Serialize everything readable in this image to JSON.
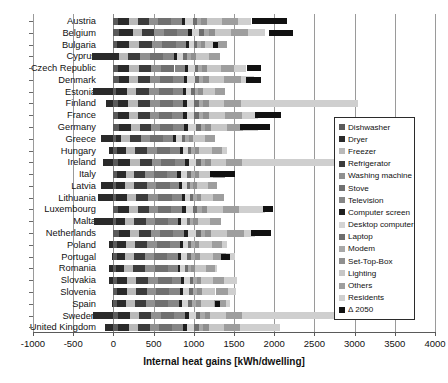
{
  "chart_data": {
    "type": "bar",
    "orientation": "horizontal",
    "stacked": true,
    "title": "",
    "xlabel": "Internal heat gains [kWh/dwelling]",
    "ylabel": "",
    "xlim": [
      -1000,
      4000
    ],
    "xticks": [
      -1000,
      -500,
      0,
      500,
      1000,
      1500,
      2000,
      2500,
      3000,
      3500,
      4000
    ],
    "grid": true,
    "legend_position": "right-inside",
    "categories": [
      "Austria",
      "Belgium",
      "Bulgaria",
      "Cyprus",
      "Czech Republic",
      "Denmark",
      "Estonia",
      "Finland",
      "France",
      "Germany",
      "Greece",
      "Hungary",
      "Ireland",
      "Italy",
      "Latvia",
      "Lithuania",
      "Luxembourg",
      "Malta",
      "Netherlands",
      "Poland",
      "Portugal",
      "Romania",
      "Slovakia",
      "Slovenia",
      "Spain",
      "Sweden",
      "United Kingdom"
    ],
    "series": [
      {
        "name": "Dishwasher",
        "color": "#5a5a5a",
        "values": [
          60,
          70,
          40,
          0,
          55,
          65,
          35,
          55,
          60,
          65,
          30,
          40,
          60,
          45,
          30,
          35,
          60,
          30,
          70,
          45,
          40,
          35,
          40,
          45,
          45,
          60,
          55
        ]
      },
      {
        "name": "Dryer",
        "color": "#2a2a2a",
        "values": [
          130,
          170,
          160,
          75,
          145,
          130,
          130,
          130,
          140,
          150,
          70,
          120,
          150,
          110,
          120,
          130,
          135,
          120,
          140,
          110,
          110,
          100,
          125,
          120,
          115,
          145,
          140
        ]
      },
      {
        "name": "Freezer",
        "color": "#b9b9b9",
        "values": [
          110,
          115,
          120,
          110,
          115,
          115,
          120,
          115,
          110,
          110,
          105,
          110,
          115,
          105,
          110,
          115,
          110,
          105,
          110,
          115,
          105,
          110,
          115,
          110,
          105,
          115,
          110
        ]
      },
      {
        "name": "Refrigerator",
        "color": "#3c3c3c",
        "values": [
          140,
          150,
          165,
          150,
          155,
          145,
          160,
          155,
          140,
          140,
          140,
          150,
          150,
          135,
          155,
          155,
          140,
          145,
          145,
          150,
          140,
          150,
          155,
          145,
          140,
          150,
          145
        ]
      },
      {
        "name": "Washing machine",
        "color": "#909090",
        "values": [
          120,
          120,
          125,
          120,
          120,
          120,
          125,
          120,
          115,
          120,
          115,
          120,
          120,
          115,
          120,
          125,
          115,
          115,
          120,
          120,
          115,
          120,
          120,
          115,
          115,
          120,
          120
        ]
      },
      {
        "name": "Stove",
        "color": "#707070",
        "values": [
          160,
          165,
          170,
          165,
          170,
          165,
          175,
          165,
          160,
          160,
          160,
          165,
          165,
          155,
          170,
          170,
          160,
          160,
          160,
          165,
          160,
          170,
          170,
          160,
          160,
          165,
          165
        ]
      },
      {
        "name": "Television",
        "color": "#868686",
        "values": [
          130,
          135,
          120,
          130,
          130,
          135,
          120,
          130,
          135,
          135,
          125,
          120,
          135,
          130,
          115,
          120,
          135,
          130,
          135,
          120,
          130,
          115,
          120,
          130,
          130,
          135,
          135
        ]
      },
      {
        "name": "Computer screen",
        "color": "#1f1f1f",
        "values": [
          45,
          50,
          35,
          40,
          40,
          45,
          35,
          45,
          50,
          50,
          35,
          35,
          45,
          40,
          30,
          35,
          45,
          35,
          50,
          35,
          40,
          30,
          35,
          40,
          40,
          45,
          45
        ]
      },
      {
        "name": "Desktop computer",
        "color": "#d4d4d4",
        "values": [
          90,
          95,
          70,
          80,
          80,
          90,
          70,
          90,
          95,
          95,
          70,
          70,
          90,
          80,
          65,
          70,
          90,
          70,
          95,
          70,
          80,
          60,
          70,
          80,
          80,
          90,
          90
        ]
      },
      {
        "name": "Laptop",
        "color": "#6e6e6e",
        "values": [
          55,
          60,
          40,
          45,
          45,
          55,
          40,
          55,
          60,
          60,
          40,
          40,
          55,
          45,
          35,
          40,
          55,
          40,
          60,
          40,
          45,
          35,
          40,
          45,
          45,
          55,
          55
        ]
      },
      {
        "name": "Modem",
        "color": "#a8a8a8",
        "values": [
          55,
          55,
          45,
          50,
          50,
          55,
          45,
          55,
          55,
          55,
          45,
          45,
          55,
          50,
          40,
          45,
          55,
          45,
          55,
          45,
          50,
          40,
          45,
          50,
          50,
          55,
          55
        ]
      },
      {
        "name": "Set-Top-Box",
        "color": "#8f8f8f",
        "values": [
          70,
          75,
          55,
          60,
          60,
          70,
          55,
          70,
          75,
          75,
          55,
          55,
          70,
          60,
          50,
          55,
          70,
          55,
          75,
          55,
          60,
          50,
          55,
          60,
          60,
          70,
          70
        ]
      },
      {
        "name": "Lighting",
        "color": "#c7c7c7",
        "values": [
          190,
          200,
          150,
          165,
          175,
          190,
          150,
          195,
          195,
          195,
          150,
          155,
          190,
          165,
          140,
          150,
          190,
          155,
          200,
          155,
          170,
          140,
          155,
          170,
          170,
          195,
          190
        ]
      },
      {
        "name": "Others",
        "color": "#9e9e9e",
        "values": [
          200,
          215,
          120,
          140,
          160,
          205,
          130,
          210,
          205,
          205,
          120,
          130,
          205,
          150,
          110,
          125,
          205,
          130,
          215,
          130,
          150,
          110,
          130,
          150,
          150,
          205,
          200
        ]
      },
      {
        "name": "Residents",
        "color": "#cfcfcf",
        "values": [
          160,
          215,
          0,
          0,
          150,
          160,
          0,
          1450,
          200,
          180,
          0,
          60,
          1380,
          0,
          0,
          0,
          320,
          0,
          130,
          60,
          120,
          20,
          160,
          110,
          40,
          1800,
          500
        ]
      }
    ],
    "negative_series": {
      "name": "Residents",
      "note": "Residents segment plotted to the left of zero for some countries",
      "values": [
        0,
        0,
        0,
        -260,
        0,
        0,
        -250,
        -90,
        0,
        0,
        -150,
        -55,
        -135,
        0,
        -155,
        -195,
        0,
        -240,
        0,
        -50,
        -20,
        -60,
        -60,
        0,
        -20,
        -255,
        -100
      ]
    },
    "delta_2050": {
      "name": "Δ 2050",
      "color": "#111111",
      "bars": [
        {
          "category": "Austria",
          "start": 1725,
          "end": 2165
        },
        {
          "category": "Belgium",
          "start": 1940,
          "end": 2240
        },
        {
          "category": "Bulgaria",
          "start": 1245,
          "end": 1295
        },
        {
          "category": "Cyprus",
          "start": null,
          "end": null
        },
        {
          "category": "Czech Republic",
          "start": 1665,
          "end": 1840
        },
        {
          "category": "Denmark",
          "start": 1655,
          "end": 1835
        },
        {
          "category": "Estonia",
          "start": null,
          "end": null
        },
        {
          "category": "Finland",
          "start": null,
          "end": null
        },
        {
          "category": "France",
          "start": 1760,
          "end": 2085
        },
        {
          "category": "Germany",
          "start": 1580,
          "end": 1950
        },
        {
          "category": "Greece",
          "start": null,
          "end": null
        },
        {
          "category": "Hungary",
          "start": null,
          "end": null
        },
        {
          "category": "Ireland",
          "start": null,
          "end": null
        },
        {
          "category": "Italy",
          "start": 1205,
          "end": 1510
        },
        {
          "category": "Latvia",
          "start": null,
          "end": null
        },
        {
          "category": "Lithuania",
          "start": null,
          "end": null
        },
        {
          "category": "Luxembourg",
          "start": 1855,
          "end": 1990
        },
        {
          "category": "Malta",
          "start": null,
          "end": null
        },
        {
          "category": "Netherlands",
          "start": 1710,
          "end": 1955
        },
        {
          "category": "Poland",
          "start": null,
          "end": null
        },
        {
          "category": "Portugal",
          "start": 1335,
          "end": 1450
        },
        {
          "category": "Romania",
          "start": null,
          "end": null
        },
        {
          "category": "Slovakia",
          "start": null,
          "end": null
        },
        {
          "category": "Slovenia",
          "start": null,
          "end": null
        },
        {
          "category": "Spain",
          "start": 1265,
          "end": 1325
        },
        {
          "category": "Sweden",
          "start": null,
          "end": null
        },
        {
          "category": "United Kingdom",
          "start": null,
          "end": null
        }
      ]
    },
    "legend_entries": [
      {
        "label": "Dishwasher",
        "color": "#5a5a5a"
      },
      {
        "label": "Dryer",
        "color": "#2a2a2a"
      },
      {
        "label": "Freezer",
        "color": "#b9b9b9"
      },
      {
        "label": "Refrigerator",
        "color": "#3c3c3c"
      },
      {
        "label": "Washing machine",
        "color": "#909090"
      },
      {
        "label": "Stove",
        "color": "#707070"
      },
      {
        "label": "Television",
        "color": "#868686"
      },
      {
        "label": "Computer screen",
        "color": "#1f1f1f"
      },
      {
        "label": "Desktop computer",
        "color": "#d4d4d4"
      },
      {
        "label": "Laptop",
        "color": "#6e6e6e"
      },
      {
        "label": "Modem",
        "color": "#a8a8a8"
      },
      {
        "label": "Set-Top-Box",
        "color": "#8f8f8f"
      },
      {
        "label": "Lighting",
        "color": "#c7c7c7"
      },
      {
        "label": "Others",
        "color": "#9e9e9e"
      },
      {
        "label": "Residents",
        "color": "#cfcfcf"
      },
      {
        "label": "Δ 2050",
        "color": "#111111"
      }
    ]
  }
}
